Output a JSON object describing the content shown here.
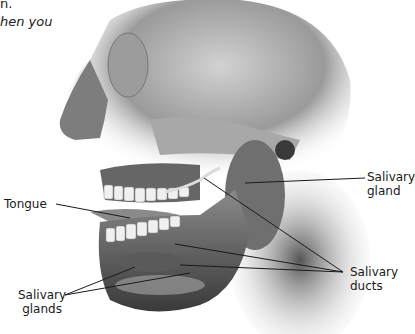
{
  "text_fragments": {
    "line1": "n.",
    "line2": "hen you"
  },
  "labels": {
    "tongue": "Tongue",
    "salivary_gland_right": [
      "Salivary",
      "gland"
    ],
    "salivary_ducts": [
      "Salivary",
      "ducts"
    ],
    "salivary_glands_left": [
      "Salivary",
      "glands"
    ]
  },
  "illustration": {
    "subject": "skull-side-view-with-salivary-glands",
    "colors": {
      "background": "#ffffff",
      "bone": "#b8b8b8",
      "shadow": "#4a4a4a",
      "line": "#1a1a1a"
    }
  }
}
